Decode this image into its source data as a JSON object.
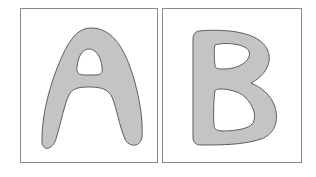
{
  "cards": [
    {
      "letter": "A",
      "fill": "#c4c4c4",
      "stroke": "#5e5e5e",
      "border": "#8a8a8a"
    },
    {
      "letter": "B",
      "fill": "#c4c4c4",
      "stroke": "#5e5e5e",
      "border": "#8a8a8a"
    }
  ]
}
